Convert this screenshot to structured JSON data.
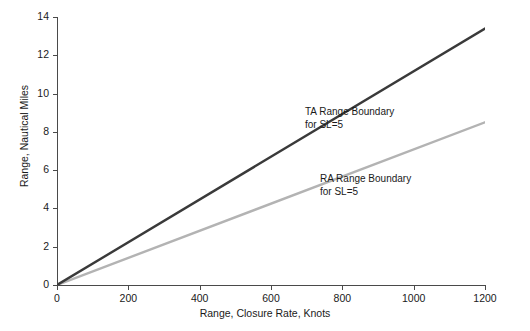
{
  "chart_data": {
    "type": "line",
    "title": "",
    "xlabel": "Range, Closure Rate, Knots",
    "ylabel": "Range, Nautical Miles",
    "xlim": [
      0,
      1200
    ],
    "ylim": [
      0,
      14
    ],
    "xticks": [
      0,
      200,
      400,
      600,
      800,
      1000,
      1200
    ],
    "xtick_labels": [
      "0",
      "200",
      "400",
      "600",
      "800",
      "1000",
      "1200"
    ],
    "yticks": [
      0,
      2,
      4,
      6,
      8,
      10,
      12,
      14
    ],
    "ytick_labels": [
      "0",
      "2",
      "4",
      "6",
      "8",
      "10",
      "12",
      "14"
    ],
    "grid": false,
    "legend_position": "inline-annotations",
    "series": [
      {
        "name": "TA Range Boundary for SL=5",
        "color": "#3a3a3a",
        "width": 2.4,
        "x": [
          0,
          1200
        ],
        "values": [
          0,
          13.4
        ]
      },
      {
        "name": "RA Range Boundary for SL=5",
        "color": "#b3b3b3",
        "width": 2.4,
        "x": [
          0,
          1200
        ],
        "values": [
          0,
          8.5
        ]
      }
    ],
    "annotations": [
      {
        "id": "ta-annotation",
        "line1": "TA Range Boundary",
        "line2": "for SL=5"
      },
      {
        "id": "ra-annotation",
        "line1": "RA Range Boundary",
        "line2": "for SL=5"
      }
    ]
  }
}
